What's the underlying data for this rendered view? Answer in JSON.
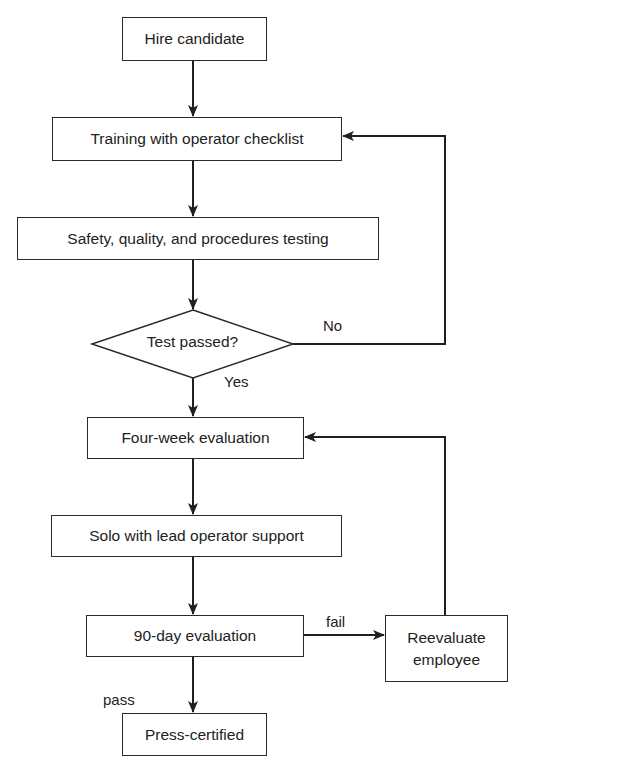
{
  "diagram": {
    "type": "flowchart",
    "colors": {
      "stroke": "#2a2a2a",
      "text": "#222222",
      "background": "#ffffff"
    },
    "nodes": [
      {
        "id": "hire",
        "shape": "rect",
        "label": "Hire candidate",
        "x": 122,
        "y": 17,
        "w": 145,
        "h": 44
      },
      {
        "id": "training",
        "shape": "rect",
        "label": "Training with operator checklist",
        "x": 52,
        "y": 117,
        "w": 290,
        "h": 44
      },
      {
        "id": "testing",
        "shape": "rect",
        "label": "Safety, quality, and procedures testing",
        "x": 17,
        "y": 217,
        "w": 362,
        "h": 43
      },
      {
        "id": "test_passed",
        "shape": "diamond",
        "label": "Test passed?",
        "x": 92,
        "y": 310,
        "w": 201,
        "h": 68
      },
      {
        "id": "four_week",
        "shape": "rect",
        "label": "Four-week evaluation",
        "x": 87,
        "y": 417,
        "w": 217,
        "h": 42
      },
      {
        "id": "solo",
        "shape": "rect",
        "label": "Solo with lead operator support",
        "x": 51,
        "y": 515,
        "w": 291,
        "h": 42
      },
      {
        "id": "ninety_day",
        "shape": "rect",
        "label": "90-day evaluation",
        "x": 86,
        "y": 615,
        "w": 218,
        "h": 42
      },
      {
        "id": "reevaluate",
        "shape": "rect",
        "label": "Reevaluate employee",
        "line1": "Reevaluate",
        "line2": "employee",
        "x": 385,
        "y": 615,
        "w": 123,
        "h": 67
      },
      {
        "id": "certified",
        "shape": "rect",
        "label": "Press-certified",
        "x": 122,
        "y": 713,
        "w": 145,
        "h": 43
      }
    ],
    "edges": [
      {
        "from": "hire",
        "to": "training",
        "label": ""
      },
      {
        "from": "training",
        "to": "testing",
        "label": ""
      },
      {
        "from": "testing",
        "to": "test_passed",
        "label": ""
      },
      {
        "from": "test_passed",
        "to": "four_week",
        "label": "Yes"
      },
      {
        "from": "test_passed",
        "to": "training",
        "label": "No"
      },
      {
        "from": "four_week",
        "to": "solo",
        "label": ""
      },
      {
        "from": "solo",
        "to": "ninety_day",
        "label": ""
      },
      {
        "from": "ninety_day",
        "to": "reevaluate",
        "label": "fail"
      },
      {
        "from": "reevaluate",
        "to": "four_week",
        "label": ""
      },
      {
        "from": "ninety_day",
        "to": "certified",
        "label": "pass"
      }
    ],
    "edge_labels": {
      "no": "No",
      "yes": "Yes",
      "fail": "fail",
      "pass": "pass"
    }
  }
}
